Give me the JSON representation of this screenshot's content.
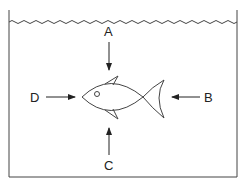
{
  "diagram": {
    "labels": {
      "A": "A",
      "B": "B",
      "C": "C",
      "D": "D"
    },
    "colors": {
      "stroke": "#333333",
      "background": "#ffffff"
    }
  }
}
